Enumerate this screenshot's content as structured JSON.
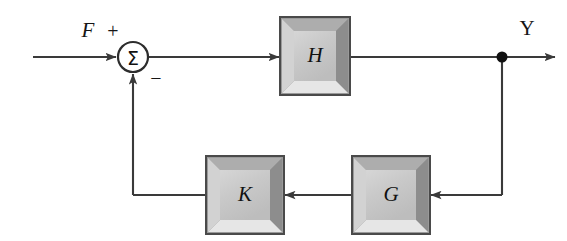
{
  "diagram": {
    "type": "feedback-control-block-diagram",
    "background_color": "#ffffff",
    "line_color": "#3a3a3a",
    "blocks": [
      {
        "id": "H",
        "label": "H",
        "role": "forward-path-plant",
        "x": 280,
        "y": 17,
        "width": 70,
        "height": 78,
        "face_color": "#c8c8c8",
        "bevel_light": "#e9e9e9",
        "bevel_dark": "#8f8f8f",
        "border_color": "#4a4a4a"
      },
      {
        "id": "K",
        "label": "K",
        "role": "feedback-gain",
        "x": 206,
        "y": 156,
        "width": 78,
        "height": 78,
        "face_color": "#c8c8c8",
        "bevel_light": "#e9e9e9",
        "bevel_dark": "#8f8f8f",
        "border_color": "#4a4a4a"
      },
      {
        "id": "G",
        "label": "G",
        "role": "feedback-sensor",
        "x": 352,
        "y": 156,
        "width": 78,
        "height": 78,
        "face_color": "#c8c8c8",
        "bevel_light": "#e9e9e9",
        "bevel_dark": "#8f8f8f",
        "border_color": "#4a4a4a"
      }
    ],
    "summing_junction": {
      "id": "sum",
      "glyph": "Σ",
      "cx": 133,
      "cy": 57,
      "r": 15,
      "plus_sign": "+",
      "minus_sign": "−",
      "plus_x": 113,
      "plus_y": 33,
      "minus_x": 156,
      "minus_y": 80
    },
    "takeoff_node": {
      "id": "y-node",
      "cx": 502,
      "cy": 57,
      "r": 5.5,
      "color": "#111111"
    },
    "signals": [
      {
        "id": "F",
        "label": "F",
        "x": 88,
        "y": 32,
        "style": "italic"
      },
      {
        "id": "Y",
        "label": "Y",
        "x": 527,
        "y": 30,
        "style": "upright"
      }
    ]
  }
}
